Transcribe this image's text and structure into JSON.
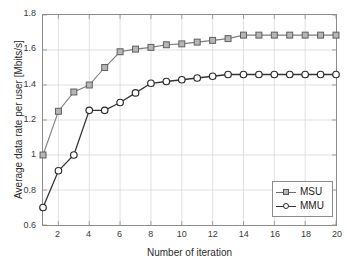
{
  "chart_data": {
    "type": "line",
    "title": "",
    "xlabel": "Number of iteration",
    "ylabel": "Average data rate per user [Mbits/s]",
    "xlim": [
      1,
      20
    ],
    "ylim": [
      0.6,
      1.8
    ],
    "xticks": [
      2,
      4,
      6,
      8,
      10,
      12,
      14,
      16,
      18,
      20
    ],
    "xtick_labels": [
      "2",
      "4",
      "6",
      "8",
      "10",
      "12",
      "14",
      "16",
      "18",
      "20"
    ],
    "yticks": [
      0.6,
      0.8,
      1.0,
      1.2,
      1.4,
      1.6,
      1.8
    ],
    "ytick_labels": [
      "0.6",
      "0.8",
      "1",
      "1.2",
      "1.4",
      "1.6",
      "1.8"
    ],
    "grid": true,
    "legend_position": "lower right",
    "x": [
      1,
      2,
      3,
      4,
      5,
      6,
      7,
      8,
      9,
      10,
      11,
      12,
      13,
      14,
      15,
      16,
      17,
      18,
      19,
      20
    ],
    "series": [
      {
        "name": "MSU",
        "marker": "square",
        "color": "#7d7d7d",
        "marker_face": "#b6b6b6",
        "values": [
          1.0,
          1.25,
          1.36,
          1.4,
          1.5,
          1.59,
          1.605,
          1.615,
          1.63,
          1.635,
          1.645,
          1.655,
          1.665,
          1.685,
          1.685,
          1.685,
          1.685,
          1.685,
          1.685,
          1.685
        ]
      },
      {
        "name": "MMU",
        "marker": "circle",
        "color": "#333333",
        "marker_face": "#ffffff",
        "values": [
          0.7,
          0.91,
          1.0,
          1.255,
          1.255,
          1.3,
          1.355,
          1.41,
          1.42,
          1.43,
          1.44,
          1.45,
          1.46,
          1.46,
          1.46,
          1.46,
          1.46,
          1.46,
          1.46,
          1.46
        ]
      }
    ]
  },
  "legend": {
    "items": [
      {
        "label": "MSU"
      },
      {
        "label": "MMU"
      }
    ]
  }
}
